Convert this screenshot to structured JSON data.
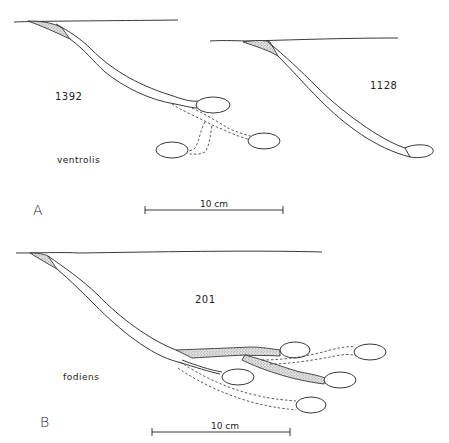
{
  "figure": {
    "panel_a": {
      "letter": "A",
      "species": "ventrolis",
      "burrows": [
        {
          "id": "1392",
          "type": "branched burrow with dashed (filled) side branches"
        },
        {
          "id": "1128",
          "type": "simple inclined burrow"
        }
      ],
      "scale_bar": "10 cm"
    },
    "panel_b": {
      "letter": "B",
      "species": "fodiens",
      "burrows": [
        {
          "id": "201",
          "type": "multi-branched burrow with stippled backfilled tunnels and dashed abandoned branches"
        }
      ],
      "scale_bar": "10 cm"
    },
    "colors": {
      "ink": "#222222",
      "stipple": "#9a9a9a",
      "background": "#ffffff"
    }
  }
}
